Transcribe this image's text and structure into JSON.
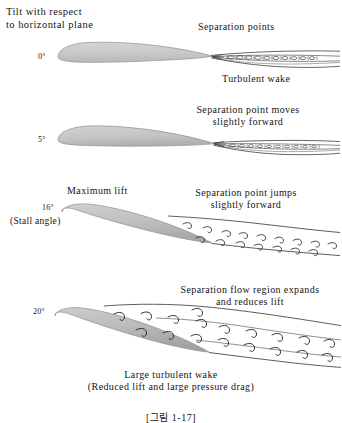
{
  "figure": {
    "header_note": "Tilt with respect\nto horizontal plane",
    "caption": "[그림 1-17]",
    "airfoil_fill": "#c9c9c9",
    "airfoil_stroke": "#8a8a8a",
    "line_color": "#222222",
    "background": "#ffffff",
    "panels": [
      {
        "angle_label": "0°",
        "sub_label": "",
        "top_label": "Separation points",
        "bottom_label": "Turbulent wake",
        "lift_label": "",
        "wake_type": "thin-turbulent",
        "angle_degrees": 0
      },
      {
        "angle_label": "5°",
        "sub_label": "",
        "top_label": "Separation point moves\nslightly forward",
        "bottom_label": "",
        "lift_label": "",
        "wake_type": "thin-turbulent",
        "angle_degrees": 5
      },
      {
        "angle_label": "16°",
        "sub_label": "(Stall angle)",
        "top_label": "Separation point jumps\nslightly forward",
        "bottom_label": "",
        "lift_label": "Maximum lift",
        "wake_type": "separated-eddies",
        "angle_degrees": 16
      },
      {
        "angle_label": "20°",
        "sub_label": "",
        "top_label": "Separation flow region expands\nand reduces lift",
        "bottom_label": "Large turbulent wake\n(Reduced lift and large pressure drag)",
        "lift_label": "",
        "wake_type": "large-separated-eddies",
        "angle_degrees": 20
      }
    ]
  }
}
